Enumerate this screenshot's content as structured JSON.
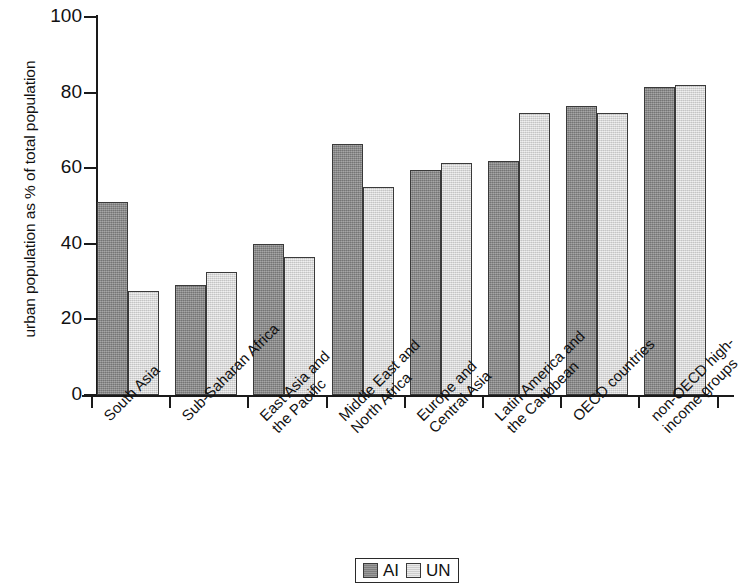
{
  "chart_data": {
    "type": "bar",
    "title": "",
    "xlabel": "",
    "ylabel": "urban population as % of total population",
    "ylim": [
      0,
      100
    ],
    "yticks": [
      0,
      20,
      40,
      60,
      80,
      100
    ],
    "ytick_labels": [
      "0",
      "20",
      "40",
      "60",
      "80",
      "100"
    ],
    "grid": false,
    "legend_position": "bottom-center",
    "categories": [
      "South Asia",
      "Sub-Saharan Africa",
      "East Asia and the Pacific",
      "Middle East and North Africa",
      "Europe and Central Asia",
      "Latin America and the Caribbean",
      "OECD countries",
      "non-OECD high-income groups"
    ],
    "category_lines": [
      [
        "South Asia"
      ],
      [
        "Sub-Saharan Africa"
      ],
      [
        "East Asia and",
        "the Pacific"
      ],
      [
        "Middle East and",
        "North Africa"
      ],
      [
        "Europe and",
        "Central Asia"
      ],
      [
        "Latin America and",
        "the Caribbean"
      ],
      [
        "OECD countries"
      ],
      [
        "non-OECD high-",
        "income groups"
      ]
    ],
    "series": [
      {
        "name": "AI",
        "color": "#8d8d8d",
        "values": [
          51,
          29,
          40,
          66.5,
          59.5,
          62,
          76.5,
          81.5
        ]
      },
      {
        "name": "UN",
        "color": "#dedede",
        "values": [
          27.5,
          32.5,
          36.5,
          55,
          61.5,
          74.5,
          74.5,
          82
        ]
      }
    ]
  },
  "legend": {
    "entries": [
      {
        "label": "AI",
        "swatch": "ai"
      },
      {
        "label": "UN",
        "swatch": "un"
      }
    ]
  }
}
